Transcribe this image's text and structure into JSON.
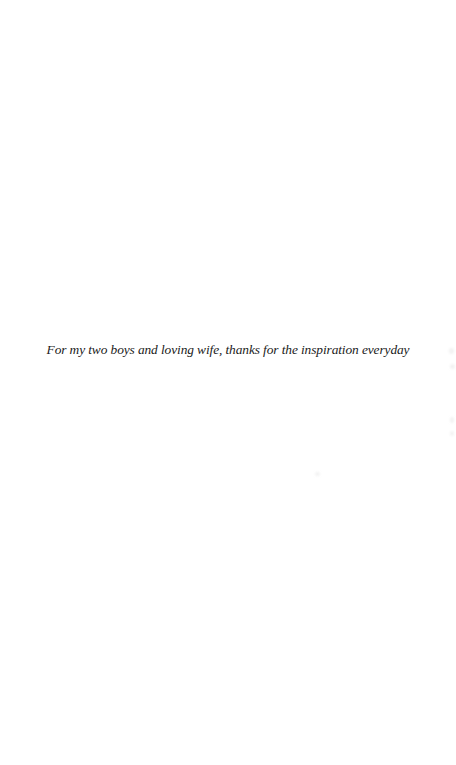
{
  "page": {
    "type": "dedication",
    "background": "#ffffff",
    "text_color": "#1a1a1a"
  },
  "dedication": {
    "text": "For my two boys and loving wife, thanks for the inspiration everyday"
  }
}
